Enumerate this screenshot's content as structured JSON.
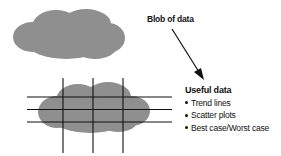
{
  "diagram": {
    "blob_label": "Blob of data",
    "useful_title": "Useful data",
    "useful_items": [
      {
        "label": "Trend lines"
      },
      {
        "label": "Scatter plots"
      },
      {
        "label": "Best case/Worst case"
      }
    ],
    "colors": {
      "cloud": "#8f8f8f",
      "lines": "#111111",
      "text": "#111111",
      "background": "#ffffff"
    },
    "grid": {
      "horizontal_lines": 3,
      "vertical_lines": 3
    }
  }
}
